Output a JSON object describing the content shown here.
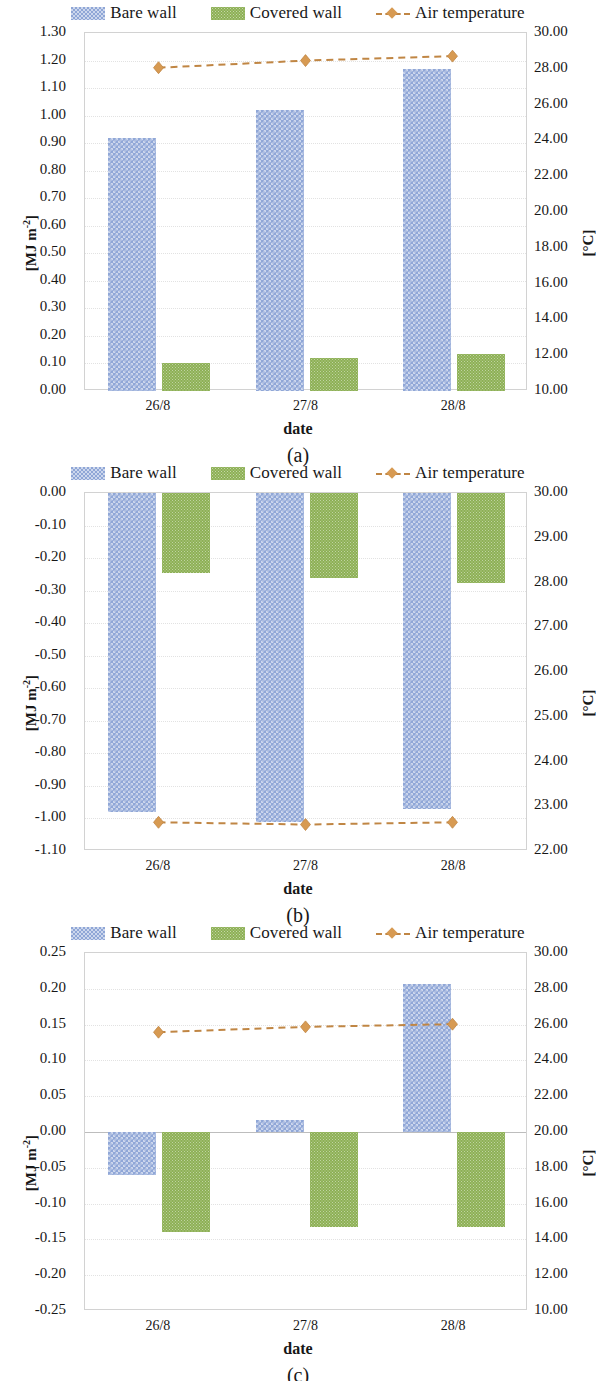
{
  "legend": {
    "items": [
      {
        "icon": "bare-wall-swatch",
        "label": "Bare wall"
      },
      {
        "icon": "covered-wall-swatch",
        "label": "Covered wall"
      },
      {
        "icon": "air-temperature-line-marker",
        "label": "Air temperature"
      }
    ]
  },
  "labels": {
    "xtitle": "date",
    "ytitle_left": "[MJ m-2]",
    "ytitle_right": "[°C]",
    "panel_a": "(a)",
    "panel_b": "(b)",
    "panel_c": "(c)"
  },
  "colors": {
    "bare_wall": "#90a7d7",
    "covered_wall": "#8db055",
    "air_temperature": "#c08644",
    "marker": "#d79a52",
    "frame": "#d2d2d2",
    "grid": "#e2e2e2"
  },
  "chart_data": [
    {
      "type": "bar",
      "panel": "(a)",
      "title": "",
      "xlabel": "date",
      "ylabel": "[MJ m-2]",
      "ylabel_right": "[°C]",
      "categories": [
        "26/8",
        "27/8",
        "28/8"
      ],
      "ylim": [
        0.0,
        1.3
      ],
      "yticks": [
        "0.00",
        "0.10",
        "0.20",
        "0.30",
        "0.40",
        "0.50",
        "0.60",
        "0.70",
        "0.80",
        "0.90",
        "1.00",
        "1.10",
        "1.20",
        "1.30"
      ],
      "y2lim": [
        10.0,
        30.0
      ],
      "y2ticks": [
        "10.00",
        "12.00",
        "14.00",
        "16.00",
        "18.00",
        "20.00",
        "22.00",
        "24.00",
        "26.00",
        "28.00",
        "30.00"
      ],
      "grid": true,
      "legend_position": "top",
      "series": [
        {
          "name": "Bare wall",
          "kind": "bar",
          "axis": "left",
          "values": [
            0.92,
            1.02,
            1.17
          ]
        },
        {
          "name": "Covered wall",
          "kind": "bar",
          "axis": "left",
          "values": [
            0.1,
            0.12,
            0.135
          ]
        },
        {
          "name": "Air temperature",
          "kind": "line",
          "axis": "right",
          "values": [
            28.05,
            28.45,
            28.7
          ]
        }
      ]
    },
    {
      "type": "bar",
      "panel": "(b)",
      "title": "",
      "xlabel": "date",
      "ylabel": "[MJ m-2]",
      "ylabel_right": "[°C]",
      "categories": [
        "26/8",
        "27/8",
        "28/8"
      ],
      "ylim": [
        -1.1,
        0.0
      ],
      "yticks": [
        "-1.10",
        "-1.00",
        "-0.90",
        "-0.80",
        "-0.70",
        "-0.60",
        "-0.50",
        "-0.40",
        "-0.30",
        "-0.20",
        "-0.10",
        "0.00"
      ],
      "y2lim": [
        22.0,
        30.0
      ],
      "y2ticks": [
        "22.00",
        "23.00",
        "24.00",
        "25.00",
        "26.00",
        "27.00",
        "28.00",
        "29.00",
        "30.00"
      ],
      "grid": true,
      "legend_position": "top",
      "series": [
        {
          "name": "Bare wall",
          "kind": "bar",
          "axis": "left",
          "values": [
            -0.98,
            -1.01,
            -0.97
          ]
        },
        {
          "name": "Covered wall",
          "kind": "bar",
          "axis": "left",
          "values": [
            -0.245,
            -0.26,
            -0.275
          ]
        },
        {
          "name": "Air temperature",
          "kind": "line",
          "axis": "right",
          "values": [
            22.6,
            22.55,
            22.6
          ]
        }
      ]
    },
    {
      "type": "bar",
      "panel": "(c)",
      "title": "",
      "xlabel": "date",
      "ylabel": "[MJ m-2]",
      "ylabel_right": "[°C]",
      "categories": [
        "26/8",
        "27/8",
        "28/8"
      ],
      "ylim": [
        -0.25,
        0.25
      ],
      "yticks": [
        "-0.25",
        "-0.20",
        "-0.15",
        "-0.10",
        "-0.05",
        "0.00",
        "0.05",
        "0.10",
        "0.15",
        "0.20",
        "0.25"
      ],
      "y2lim": [
        10.0,
        30.0
      ],
      "y2ticks": [
        "10.00",
        "12.00",
        "14.00",
        "16.00",
        "18.00",
        "20.00",
        "22.00",
        "24.00",
        "26.00",
        "28.00",
        "30.00"
      ],
      "grid": true,
      "legend_position": "top",
      "series": [
        {
          "name": "Bare wall",
          "kind": "bar",
          "axis": "left",
          "values": [
            -0.06,
            0.017,
            0.207
          ]
        },
        {
          "name": "Covered wall",
          "kind": "bar",
          "axis": "left",
          "values": [
            -0.14,
            -0.132,
            -0.132
          ]
        },
        {
          "name": "Air temperature",
          "kind": "line",
          "axis": "right",
          "values": [
            25.55,
            25.85,
            26.0
          ]
        }
      ]
    }
  ]
}
